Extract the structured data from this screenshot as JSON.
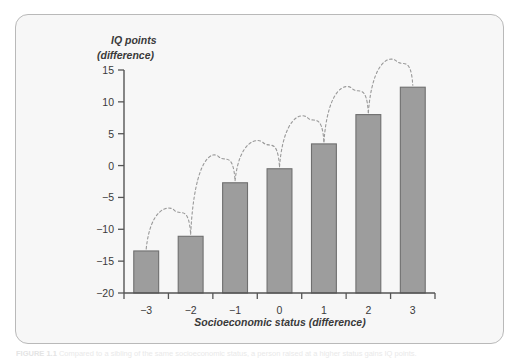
{
  "figure": {
    "caption_prefix": "FIGURE 1.1",
    "caption_text": "Compared to a sibling of the same socioeconomic status, a person raised at a higher status gains IQ points."
  },
  "chart_data": {
    "type": "bar",
    "title": "",
    "ylabel_line1": "IQ points",
    "ylabel_line2": "(difference)",
    "xlabel": "Socioeconomic status (difference)",
    "categories": [
      "−3",
      "−2",
      "−1",
      "0",
      "1",
      "2",
      "3"
    ],
    "values": [
      -13.4,
      -11.1,
      -2.7,
      -0.5,
      3.4,
      8.0,
      12.3
    ],
    "ylim": [
      -20,
      15
    ],
    "ytick_labels": [
      "15",
      "10",
      "5",
      "0",
      "−5",
      "−10",
      "−15",
      "−20"
    ],
    "ytick_values": [
      15,
      10,
      5,
      0,
      -5,
      -10,
      -15,
      -20
    ],
    "grid": false,
    "legend": "none",
    "annotation": "dashed arcs connect consecutive bar tops",
    "colors": {
      "bar_fill": "#9d9d9d",
      "bar_stroke": "#6f6f6f",
      "axis": "#555555",
      "text": "#3a3a3a",
      "arc": "#999999",
      "card_bg": "#f7f7f7",
      "card_border": "#b9b9b9"
    }
  }
}
